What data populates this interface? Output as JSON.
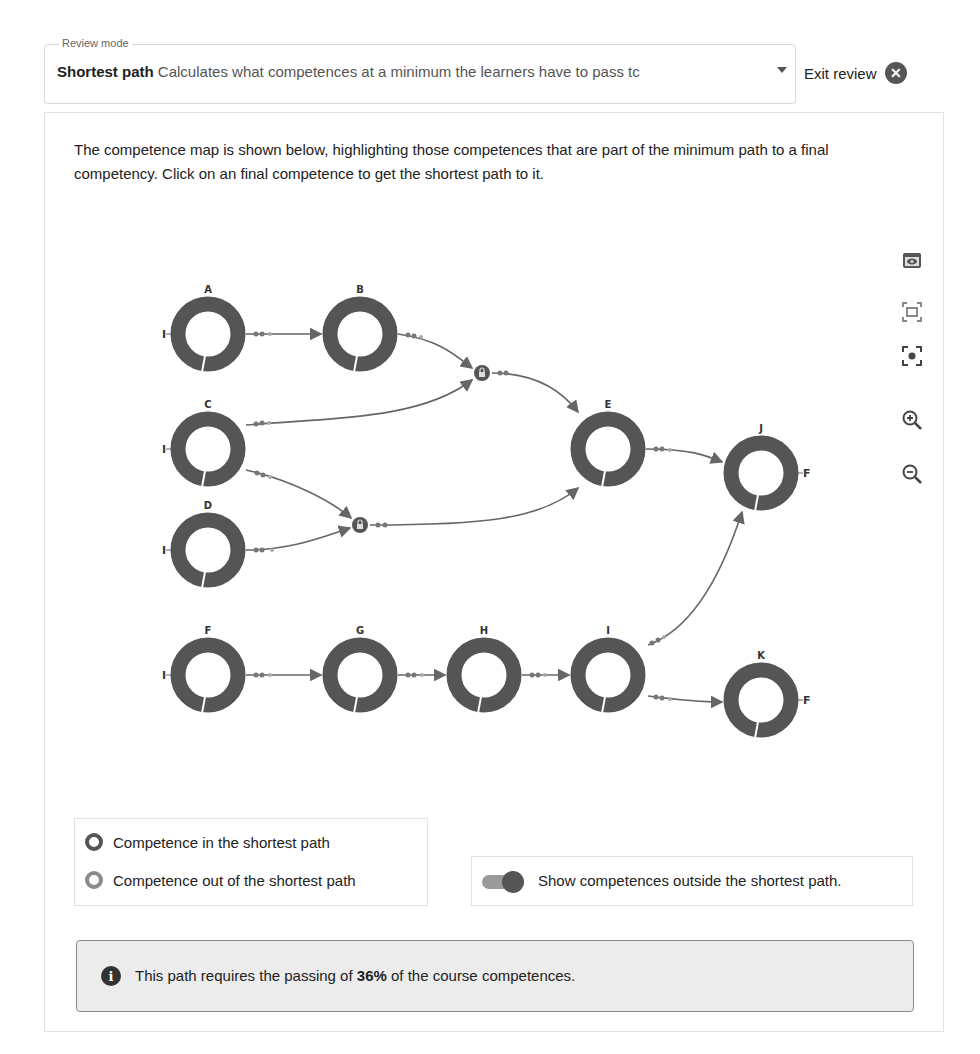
{
  "review": {
    "legend": "Review mode",
    "mode_label": "Shortest path",
    "mode_description": "Calculates what competences at a minimum the learners have to pass tc",
    "exit_label": "Exit review",
    "exit_icon": "close-circle-icon"
  },
  "intro": {
    "text": "The competence map is shown below, highlighting those competences that are part of the minimum path to a final competency. Click on an final competence to get the shortest path to it."
  },
  "toolbar": {
    "items": [
      {
        "name": "eye-icon",
        "label": "Toggle view"
      },
      {
        "name": "fit-screen-icon",
        "label": "Fit"
      },
      {
        "name": "center-focus-icon",
        "label": "Center"
      },
      {
        "name": "zoom-in-icon",
        "label": "Zoom in"
      },
      {
        "name": "zoom-out-icon",
        "label": "Zoom out"
      }
    ]
  },
  "map": {
    "colors": {
      "in_path": "#555555",
      "out_path": "#8a8a8a",
      "edge": "#666666"
    },
    "nodes": [
      {
        "id": "A",
        "label": "A",
        "x": 208,
        "y": 334,
        "side": "I"
      },
      {
        "id": "B",
        "label": "B",
        "x": 360,
        "y": 334,
        "side": ""
      },
      {
        "id": "C",
        "label": "C",
        "x": 208,
        "y": 449,
        "side": "I"
      },
      {
        "id": "D",
        "label": "D",
        "x": 208,
        "y": 550,
        "side": "I"
      },
      {
        "id": "E",
        "label": "E",
        "x": 608,
        "y": 449,
        "side": ""
      },
      {
        "id": "J",
        "label": "J",
        "x": 761,
        "y": 473,
        "side": "F"
      },
      {
        "id": "F",
        "label": "F",
        "x": 208,
        "y": 675,
        "side": "I"
      },
      {
        "id": "G",
        "label": "G",
        "x": 360,
        "y": 675,
        "side": ""
      },
      {
        "id": "H",
        "label": "H",
        "x": 484,
        "y": 675,
        "side": ""
      },
      {
        "id": "I",
        "label": "I",
        "x": 608,
        "y": 675,
        "side": ""
      },
      {
        "id": "K",
        "label": "K",
        "x": 761,
        "y": 700,
        "side": "F"
      }
    ],
    "junctions": [
      {
        "id": "lock1",
        "icon": "lock-icon",
        "x": 482,
        "y": 373
      },
      {
        "id": "lock2",
        "icon": "lock-icon",
        "x": 360,
        "y": 525
      }
    ]
  },
  "legend": {
    "in_path": "Competence in the shortest path",
    "out_path": "Competence out of the shortest path"
  },
  "toggle": {
    "label": "Show competences outside the shortest path.",
    "checked": true
  },
  "info": {
    "prefix": "This path requires the passing of ",
    "percent": "36%",
    "suffix": " of the course competences."
  }
}
